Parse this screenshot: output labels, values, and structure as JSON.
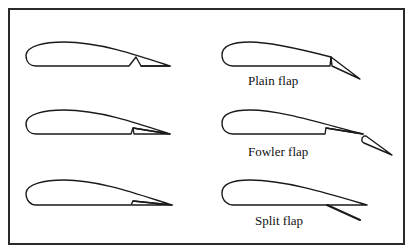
{
  "figure": {
    "colors": {
      "stroke": "#1a1a1a",
      "frame": "#2a2a2a",
      "background": "#ffffff"
    }
  },
  "panels": [
    {
      "id": "plain",
      "label": "Plain flap",
      "state_left": "retracted",
      "state_right": "deflected"
    },
    {
      "id": "fowler",
      "label": "Fowler flap",
      "state_left": "retracted",
      "state_right": "extended-deflected"
    },
    {
      "id": "split",
      "label": "Split flap",
      "state_left": "retracted",
      "state_right": "deflected"
    }
  ]
}
